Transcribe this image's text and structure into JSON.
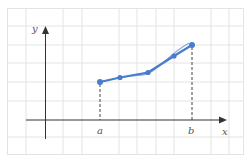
{
  "diagram": {
    "type": "function-graph",
    "axes": {
      "x_label": "x",
      "y_label": "y",
      "tick_labels": [
        {
          "label": "a",
          "x": 100
        },
        {
          "label": "b",
          "x": 192
        }
      ]
    },
    "points": [
      {
        "x": 100,
        "y": 82
      },
      {
        "x": 120,
        "y": 77.5
      },
      {
        "x": 148,
        "y": 72.5
      },
      {
        "x": 174,
        "y": 56
      },
      {
        "x": 192,
        "y": 45
      }
    ],
    "colors": {
      "grid": "#e3e3e3",
      "axis": "#333333",
      "curve": "#7a9fd6",
      "polyline": "#4a7ccc",
      "point": "#4a7ccc",
      "dashed": "#444444",
      "label": "#555555"
    }
  }
}
